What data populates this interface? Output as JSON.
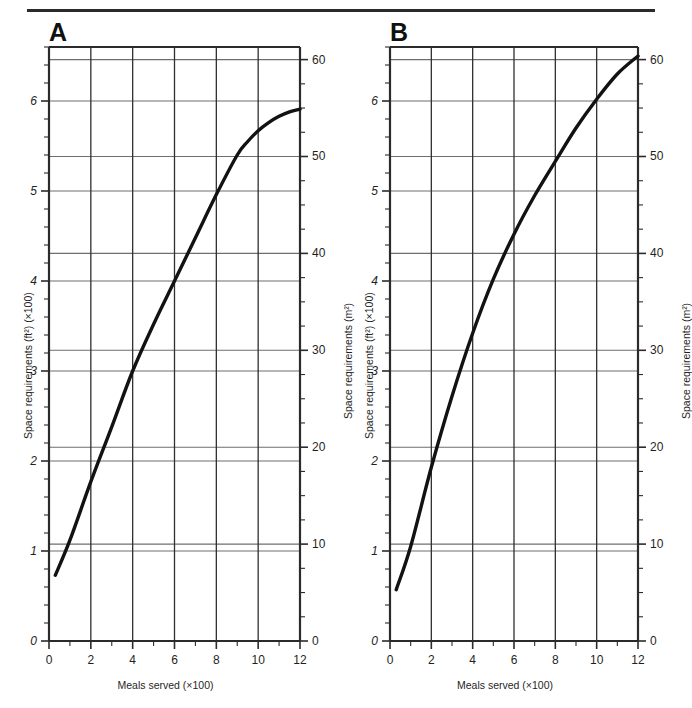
{
  "figure": {
    "panels": [
      {
        "letter": "A",
        "name": "panel-a",
        "left_axis_title": "Space requirements (ft²) (×100)",
        "right_axis_title": "Space requirements (m²)",
        "x_axis_title": "Meals served (×100)"
      },
      {
        "letter": "B",
        "name": "panel-b",
        "left_axis_title": "Space requirements (ft²) (×100)",
        "right_axis_title": "Space requirements (m²)",
        "x_axis_title": "Meals served (×100)"
      }
    ]
  },
  "chart_data": [
    {
      "type": "line",
      "panel": "A",
      "title": "A",
      "xlabel": "Meals served (×100)",
      "ylabel": "Space requirements (ft²) (×100)",
      "y2label": "Space requirements (m²)",
      "xlim": [
        0,
        12
      ],
      "ylim": [
        0,
        6.6
      ],
      "y2lim": [
        0,
        61.3
      ],
      "xticks": [
        0,
        2,
        4,
        6,
        8,
        10,
        12
      ],
      "xticklabels": [
        "0",
        "2",
        "4",
        "6",
        "8",
        "10",
        "12"
      ],
      "xminorticks": [
        1,
        3,
        5,
        7,
        9,
        11
      ],
      "yticks": [
        0,
        1,
        2,
        3,
        4,
        5,
        6
      ],
      "yticklabels": [
        "0",
        "1",
        "2",
        "3",
        "4",
        "5",
        "6"
      ],
      "y2ticks": [
        0,
        10,
        20,
        30,
        40,
        50,
        60
      ],
      "y2ticklabels": [
        "0",
        "10",
        "20",
        "30",
        "40",
        "50",
        "60"
      ],
      "grid": true,
      "gridlines_x": [
        2,
        4,
        6,
        8,
        10
      ],
      "gridlines_y_ft": [
        1,
        2,
        3,
        4,
        5,
        6
      ],
      "gridlines_y_m2": [
        10,
        20,
        30,
        40,
        50,
        60
      ],
      "series": [
        {
          "name": "Space requirement curve A",
          "x": [
            0.3,
            1.0,
            2.0,
            3.0,
            4.0,
            5.0,
            6.0,
            7.0,
            8.0,
            9.0,
            9.5,
            10.0,
            10.5,
            11.0,
            11.5,
            12.0
          ],
          "y": [
            0.73,
            1.12,
            1.77,
            2.38,
            3.0,
            3.52,
            4.0,
            4.48,
            4.96,
            5.4,
            5.55,
            5.67,
            5.76,
            5.83,
            5.88,
            5.91
          ]
        }
      ]
    },
    {
      "type": "line",
      "panel": "B",
      "title": "B",
      "xlabel": "Meals served (×100)",
      "ylabel": "Space requirements (ft²) (×100)",
      "y2label": "Space requirements (m²)",
      "xlim": [
        0,
        12
      ],
      "ylim": [
        0,
        6.6
      ],
      "y2lim": [
        0,
        61.3
      ],
      "xticks": [
        0,
        2,
        4,
        6,
        8,
        10,
        12
      ],
      "xticklabels": [
        "0",
        "2",
        "4",
        "6",
        "8",
        "10",
        "12"
      ],
      "xminorticks": [
        1,
        3,
        5,
        7,
        9,
        11
      ],
      "yticks": [
        0,
        1,
        2,
        3,
        4,
        5,
        6
      ],
      "yticklabels": [
        "0",
        "1",
        "2",
        "3",
        "4",
        "5",
        "6"
      ],
      "y2ticks": [
        0,
        10,
        20,
        30,
        40,
        50,
        60
      ],
      "y2ticklabels": [
        "0",
        "10",
        "20",
        "30",
        "40",
        "50",
        "60"
      ],
      "grid": true,
      "gridlines_x": [
        2,
        4,
        6,
        8,
        10
      ],
      "gridlines_y_ft": [
        1,
        2,
        3,
        4,
        5,
        6
      ],
      "gridlines_y_m2": [
        10,
        20,
        30,
        40,
        50,
        60
      ],
      "series": [
        {
          "name": "Space requirement curve B",
          "x": [
            0.3,
            1.0,
            2.0,
            3.0,
            4.0,
            5.0,
            6.0,
            7.0,
            8.0,
            9.0,
            10.0,
            11.0,
            12.0
          ],
          "y": [
            0.57,
            1.05,
            1.93,
            2.72,
            3.42,
            4.02,
            4.52,
            4.95,
            5.33,
            5.7,
            6.02,
            6.3,
            6.5
          ]
        }
      ]
    }
  ],
  "style": {
    "frame_color": "#2b2b2b",
    "grid_color": "#6e6e6e",
    "curve_color": "#121212",
    "tick_label_color": "#1f1f1f",
    "background": "#ffffff"
  }
}
